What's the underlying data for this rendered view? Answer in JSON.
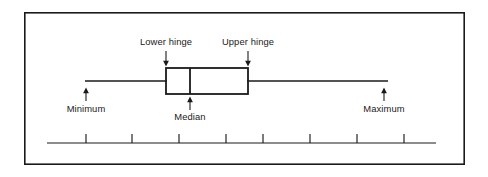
{
  "figure": {
    "background_color": "#ffffff",
    "stroke_color": "#1a1a1a",
    "border": {
      "name": "figure-frame",
      "x": 24,
      "y": 12,
      "width": 441,
      "height": 153,
      "stroke_width": 1.6
    }
  },
  "chart_data": {
    "type": "boxplot",
    "xlabel": "",
    "ylabel": "",
    "grid": false,
    "legend": "none",
    "orientation": "horizontal",
    "axis": {
      "name": "number-line-axis",
      "x_start": 47,
      "x_end": 436,
      "y": 143,
      "tick_count": 8,
      "tick_positions": [
        86,
        132,
        179,
        226,
        263,
        310,
        357,
        404
      ],
      "tick_length": 9,
      "tick_labels": [],
      "xlim": [
        47,
        436
      ]
    },
    "box": {
      "lower_hinge_x": 166,
      "upper_hinge_x": 248,
      "median_x": 190,
      "top_y": 68,
      "bottom_y": 94,
      "fill": "none",
      "stroke_width": 1.8
    },
    "whiskers": {
      "center_y": 81,
      "minimum_x": 85,
      "maximum_x": 388,
      "stroke_width": 1.3
    },
    "annotations": [
      {
        "id": "lower-hinge",
        "label": "Lower hinge",
        "value_x": 166,
        "label_x": 166,
        "label_y": 45,
        "anchor": "middle",
        "arrow": {
          "x": 166,
          "from_y": 51,
          "to_y": 65,
          "direction": "down"
        }
      },
      {
        "id": "upper-hinge",
        "label": "Upper hinge",
        "value_x": 248,
        "label_x": 248,
        "label_y": 45,
        "anchor": "middle",
        "arrow": {
          "x": 248,
          "from_y": 51,
          "to_y": 65,
          "direction": "down"
        }
      },
      {
        "id": "median",
        "label": "Median",
        "value_x": 190,
        "label_x": 190,
        "label_y": 118,
        "anchor": "middle",
        "arrow": {
          "x": 190,
          "from_y": 110,
          "to_y": 97,
          "direction": "up"
        }
      },
      {
        "id": "minimum",
        "label": "Minimum",
        "value_x": 86,
        "label_x": 86,
        "label_y": 112,
        "anchor": "middle",
        "arrow": {
          "x": 86,
          "from_y": 104,
          "to_y": 88,
          "direction": "up"
        }
      },
      {
        "id": "maximum",
        "label": "Maximum",
        "value_x": 384,
        "label_x": 384,
        "label_y": 112,
        "anchor": "middle",
        "arrow": {
          "x": 384,
          "from_y": 104,
          "to_y": 88,
          "direction": "up"
        }
      }
    ]
  }
}
